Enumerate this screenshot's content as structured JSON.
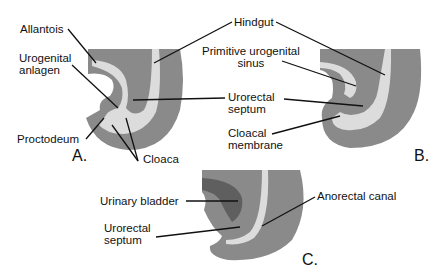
{
  "colors": {
    "tissue": "#8a8a8a",
    "lumen": "#dcdcdc",
    "bladder": "#5f5f5f",
    "line": "#111111",
    "background": "#ffffff"
  },
  "panels": {
    "A": {
      "letter": "A.",
      "labels": {
        "allantois": "Allantois",
        "urogenital_anlagen": "Urogenital\nanlagen",
        "proctodeum": "Proctodeum",
        "cloaca": "Cloaca"
      }
    },
    "shared": {
      "hindgut": "Hindgut",
      "urorectal_septum": "Urorectal\nseptum"
    },
    "B": {
      "letter": "B.",
      "labels": {
        "primitive_urogenital_sinus": "Primitive urogenital\nsinus",
        "cloacal_membrane": "Cloacal\nmembrane"
      }
    },
    "C": {
      "letter": "C.",
      "labels": {
        "urinary_bladder": "Urinary bladder",
        "urorectal_septum": "Urorectal\nseptum",
        "anorectal_canal": "Anorectal canal"
      }
    }
  }
}
